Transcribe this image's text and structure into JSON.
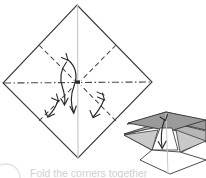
{
  "figure": {
    "kind": "origami-fold-diagram",
    "title": "",
    "caption": "Fold the corners together",
    "colors": {
      "paper_outline": "#3b3b3b",
      "fold_dashed": "#4a4a4a",
      "center_line_vertical": "#c9c9c9",
      "center_line_horizontal": "#4a4a4a",
      "arrow": "#2b2b2b",
      "shade_top": "#9a9a9a",
      "shade_mid": "#b6b6b6",
      "shade_dark": "#7d7d7d",
      "paper_white": "#ffffff",
      "caption_text": "#cfcfcf",
      "bullet_circle": "#e2e2e2"
    },
    "main_shape": {
      "name": "square-rotated-45",
      "label": "diamond",
      "vertices": [
        {
          "name": "top",
          "x": 77,
          "y": 5
        },
        {
          "name": "right",
          "x": 152,
          "y": 82
        },
        {
          "name": "bottom",
          "x": 78,
          "y": 158
        },
        {
          "name": "left",
          "x": 3,
          "y": 83
        }
      ]
    },
    "crease_lines": [
      {
        "name": "vertical-center-crease",
        "style": "solid-light",
        "from": [
          77,
          5
        ],
        "to": [
          78,
          158
        ]
      },
      {
        "name": "horizontal-center-crease",
        "style": "dash-dot",
        "from": [
          3,
          83
        ],
        "to": [
          152,
          82
        ]
      },
      {
        "name": "upper-left-diagonal-fold",
        "style": "dashed",
        "from": [
          40,
          46
        ],
        "to": [
          76,
          82
        ]
      },
      {
        "name": "upper-right-diagonal-fold",
        "style": "dashed",
        "from": [
          115,
          46
        ],
        "to": [
          79,
          82
        ]
      },
      {
        "name": "lower-left-diagonal-fold",
        "style": "dashed",
        "from": [
          40,
          120
        ],
        "to": [
          76,
          84
        ]
      },
      {
        "name": "lower-right-diagonal-fold",
        "style": "dashed",
        "from": [
          115,
          120
        ],
        "to": [
          79,
          84
        ]
      }
    ],
    "arrows": [
      {
        "name": "fold-arrow-top-center-down",
        "type": "curved",
        "direction": "down"
      },
      {
        "name": "fold-arrow-left-center-up",
        "type": "curved",
        "direction": "up-left"
      },
      {
        "name": "fold-arrow-lower-left-outward",
        "type": "curved",
        "direction": "down-left"
      },
      {
        "name": "fold-arrow-lower-right-inward",
        "type": "curved",
        "direction": "down-left"
      },
      {
        "name": "fold-arrow-3d-down",
        "type": "straight",
        "direction": "down"
      }
    ],
    "inset_3d": {
      "name": "folded-result-3d",
      "description": "partially folded paper seen in perspective with two shaded flaps and a downward arrow",
      "bounds": {
        "x": 122,
        "y": 110,
        "width": 84,
        "height": 68
      }
    }
  }
}
